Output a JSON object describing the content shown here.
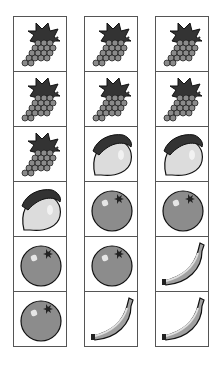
{
  "grid": {
    "columns": [
      {
        "items": [
          "grapes",
          "grapes",
          "grapes",
          "lemon",
          "orange",
          "orange"
        ]
      },
      {
        "items": [
          "grapes",
          "grapes",
          "lemon",
          "orange",
          "orange",
          "banana"
        ]
      },
      {
        "items": [
          "grapes",
          "grapes",
          "lemon",
          "orange",
          "banana",
          "banana"
        ]
      }
    ]
  },
  "colors": {
    "leaf": "#3a3a3a",
    "grape": "#8a8a8a",
    "lemon": "#dcdcdc",
    "orange": "#8c8c8c",
    "banana": "#a0a0a0",
    "border": "#555555"
  }
}
